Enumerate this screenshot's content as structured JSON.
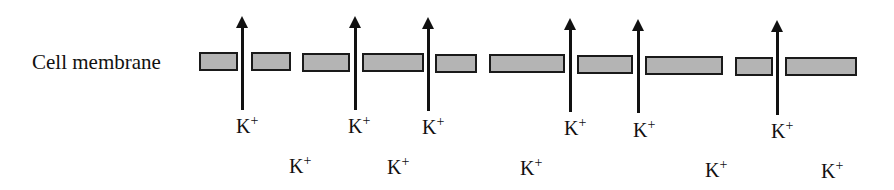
{
  "diagram": {
    "membrane_label": "Cell membrane",
    "ion_symbol": "K",
    "ion_charge": "+",
    "colors": {
      "membrane_fill": "#b4b4b4",
      "outline": "#1a1a1a",
      "arrow": "#111111"
    },
    "membrane_segments": [
      {
        "x": 199,
        "w": 39,
        "y": 52
      },
      {
        "x": 251,
        "w": 40,
        "y": 52
      },
      {
        "x": 302,
        "w": 48,
        "y": 53
      },
      {
        "x": 362,
        "w": 62,
        "y": 53
      },
      {
        "x": 435,
        "w": 42,
        "y": 54
      },
      {
        "x": 489,
        "w": 76,
        "y": 54
      },
      {
        "x": 577,
        "w": 56,
        "y": 55
      },
      {
        "x": 645,
        "w": 78,
        "y": 56
      },
      {
        "x": 735,
        "w": 38,
        "y": 57
      },
      {
        "x": 785,
        "w": 72,
        "y": 57
      }
    ],
    "channel_arrows": [
      {
        "x": 242,
        "top": 16,
        "bottom": 110,
        "direction": "up"
      },
      {
        "x": 355,
        "top": 16,
        "bottom": 110,
        "direction": "up"
      },
      {
        "x": 428,
        "top": 17,
        "bottom": 111,
        "direction": "up"
      },
      {
        "x": 570,
        "top": 18,
        "bottom": 112,
        "direction": "up"
      },
      {
        "x": 638,
        "top": 19,
        "bottom": 113,
        "direction": "up"
      },
      {
        "x": 777,
        "top": 20,
        "bottom": 115,
        "direction": "up"
      }
    ],
    "channel_ions": [
      {
        "x": 236,
        "y": 115,
        "text": "K",
        "charge": "+"
      },
      {
        "x": 348,
        "y": 115,
        "text": "K",
        "charge": "+"
      },
      {
        "x": 422,
        "y": 116,
        "text": "K",
        "charge": "+"
      },
      {
        "x": 564,
        "y": 117,
        "text": "K",
        "charge": "+"
      },
      {
        "x": 633,
        "y": 119,
        "text": "K",
        "charge": "+"
      },
      {
        "x": 771,
        "y": 120,
        "text": "K",
        "charge": "+"
      }
    ],
    "free_ions": [
      {
        "x": 289,
        "y": 155,
        "text": "K",
        "charge": "+"
      },
      {
        "x": 387,
        "y": 156,
        "text": "K",
        "charge": "+"
      },
      {
        "x": 520,
        "y": 157,
        "text": "K",
        "charge": "+"
      },
      {
        "x": 705,
        "y": 159,
        "text": "K",
        "charge": "+"
      },
      {
        "x": 821,
        "y": 160,
        "text": "K",
        "charge": "+"
      }
    ]
  }
}
